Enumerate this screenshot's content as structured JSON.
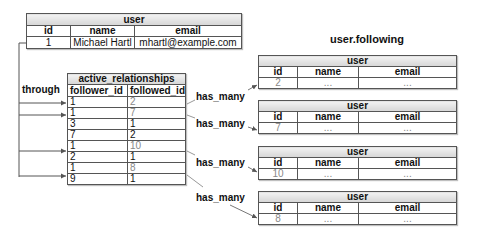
{
  "heading": "user.following",
  "user_table": {
    "title": "user",
    "columns": [
      "id",
      "name",
      "email"
    ],
    "row": [
      "1",
      "Michael Hartl",
      "mhartl@example.com"
    ]
  },
  "through_label": "through",
  "relationships_table": {
    "title": "active_relationships",
    "columns": [
      "follower_id",
      "followed_id"
    ],
    "rows": [
      {
        "follower_id": "1",
        "followed_id": "2",
        "highlighted": true
      },
      {
        "follower_id": "1",
        "followed_id": "7",
        "highlighted": true
      },
      {
        "follower_id": "3",
        "followed_id": "1",
        "highlighted": false
      },
      {
        "follower_id": "7",
        "followed_id": "2",
        "highlighted": false
      },
      {
        "follower_id": "1",
        "followed_id": "10",
        "highlighted": true
      },
      {
        "follower_id": "2",
        "followed_id": "1",
        "highlighted": false
      },
      {
        "follower_id": "1",
        "followed_id": "8",
        "highlighted": true
      },
      {
        "follower_id": "9",
        "followed_id": "1",
        "highlighted": false
      }
    ]
  },
  "has_many_label": "has_many",
  "followed_users": [
    {
      "title": "user",
      "columns": [
        "id",
        "name",
        "email"
      ],
      "row": [
        "2",
        "...",
        "..."
      ]
    },
    {
      "title": "user",
      "columns": [
        "id",
        "name",
        "email"
      ],
      "row": [
        "7",
        "...",
        "..."
      ]
    },
    {
      "title": "user",
      "columns": [
        "id",
        "name",
        "email"
      ],
      "row": [
        "10",
        "...",
        "..."
      ]
    },
    {
      "title": "user",
      "columns": [
        "id",
        "name",
        "email"
      ],
      "row": [
        "8",
        "...",
        "..."
      ]
    }
  ]
}
